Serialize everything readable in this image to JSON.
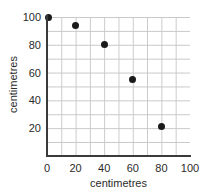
{
  "chart_data": {
    "type": "scatter",
    "title": "",
    "xlabel": "centimetres",
    "ylabel": "centimetres",
    "xlim": [
      0,
      100
    ],
    "ylim": [
      0,
      100
    ],
    "grid": true,
    "grid_step": 10,
    "legend": "none",
    "x_ticks": [
      "0",
      "20",
      "40",
      "60",
      "80",
      "100"
    ],
    "x_tick_values": [
      0,
      20,
      40,
      60,
      80,
      100
    ],
    "y_ticks": [
      "20",
      "40",
      "60",
      "80",
      "100"
    ],
    "y_tick_values": [
      20,
      40,
      60,
      80,
      100
    ],
    "series": [
      {
        "name": "measurements",
        "color": "#1a1a1a",
        "points": [
          {
            "x": 1,
            "y": 100
          },
          {
            "x": 20,
            "y": 94
          },
          {
            "x": 40,
            "y": 80
          },
          {
            "x": 60,
            "y": 55
          },
          {
            "x": 80,
            "y": 21
          }
        ]
      }
    ]
  },
  "axes": {
    "x_title": "centimetres",
    "y_title": "centimetres"
  },
  "ticks": {
    "x": [
      {
        "label": "0",
        "value": 0
      },
      {
        "label": "20",
        "value": 20
      },
      {
        "label": "40",
        "value": 40
      },
      {
        "label": "60",
        "value": 60
      },
      {
        "label": "80",
        "value": 80
      },
      {
        "label": "100",
        "value": 100
      }
    ],
    "y": [
      {
        "label": "20",
        "value": 20
      },
      {
        "label": "40",
        "value": 40
      },
      {
        "label": "60",
        "value": 60
      },
      {
        "label": "80",
        "value": 80
      },
      {
        "label": "100",
        "value": 100
      }
    ]
  },
  "colors": {
    "point": "#1a1a1a",
    "grid": "#c9c9c9",
    "axis": "#3a3a3a",
    "text": "#2b2b2b",
    "background": "#ffffff"
  }
}
